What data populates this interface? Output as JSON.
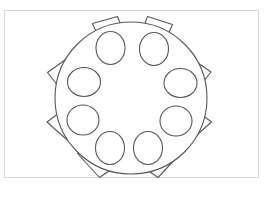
{
  "diagram": {
    "type": "seating-chart",
    "background_color": "#ffffff",
    "stroke_color": "#58585a",
    "fill_color": "#ffffff",
    "frame": {
      "color": "#d8d8d8",
      "x": 4,
      "y": 10,
      "width": 255,
      "height": 168
    },
    "table": {
      "label": "round-table",
      "center_x": 131,
      "center_y": 98,
      "radius": 76
    },
    "seat_count": 10,
    "seats": [
      {
        "label": "seat-1",
        "angle_deg": -72,
        "head_cx": 110.5,
        "head_cy": 48,
        "head_rx": 14.5,
        "head_ry": 16.5
      },
      {
        "label": "seat-2",
        "angle_deg": -36,
        "head_cx": 154.5,
        "head_cy": 49,
        "head_rx": 14.5,
        "head_ry": 16.5
      },
      {
        "label": "seat-3",
        "angle_deg": 0,
        "head_cx": 180.5,
        "head_cy": 83,
        "head_rx": 16.5,
        "head_ry": 14.5
      },
      {
        "label": "seat-4",
        "angle_deg": 36,
        "head_cx": 176,
        "head_cy": 121,
        "head_rx": 16,
        "head_ry": 15
      },
      {
        "label": "seat-5",
        "angle_deg": 72,
        "head_cx": 148,
        "head_cy": 148,
        "head_rx": 14.5,
        "head_ry": 16.5
      },
      {
        "label": "seat-6",
        "angle_deg": 108,
        "head_cx": 110,
        "head_cy": 148,
        "head_rx": 14.5,
        "head_ry": 16.5
      },
      {
        "label": "seat-7",
        "angle_deg": 144,
        "head_cx": 83,
        "head_cy": 120,
        "head_rx": 16,
        "head_ry": 15
      },
      {
        "label": "seat-8",
        "angle_deg": 180,
        "head_cx": 84,
        "head_cy": 82,
        "head_rx": 16.5,
        "head_ry": 14.5
      },
      {
        "label": "seat-9",
        "angle_deg": -144,
        "head_cx": 110.5,
        "head_cy": 48,
        "head_rx": 14.5,
        "head_ry": 16.5
      },
      {
        "label": "seat-10",
        "angle_deg": -108,
        "head_cx": 154.5,
        "head_cy": 49,
        "head_rx": 14.5,
        "head_ry": 16.5
      }
    ]
  }
}
